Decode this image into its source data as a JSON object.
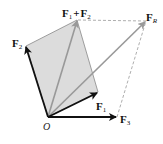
{
  "diagram": {
    "type": "vector-addition",
    "origin": {
      "label": "O",
      "x": 48,
      "y": 117
    },
    "vectors": [
      {
        "id": "F1",
        "label": "F",
        "subscript": "1",
        "tip": {
          "x": 98,
          "y": 92
        },
        "color": "#111111"
      },
      {
        "id": "F2",
        "label": "F",
        "subscript": "2",
        "tip": {
          "x": 26,
          "y": 46
        },
        "color": "#111111"
      },
      {
        "id": "F3",
        "label": "F",
        "subscript": "3",
        "tip": {
          "x": 117,
          "y": 117
        },
        "color": "#111111"
      },
      {
        "id": "F1plusF2",
        "label": "F",
        "subscript": "1",
        "plus": "+",
        "label2": "F",
        "subscript2": "2",
        "tip": {
          "x": 77,
          "y": 20
        },
        "color": "#999999"
      },
      {
        "id": "FR",
        "label": "F",
        "subscript": "R",
        "tip": {
          "x": 146,
          "y": 21
        },
        "color": "#999999"
      }
    ],
    "parallelogram_fill": "#dcdcdc",
    "parallelogram_edge": "#888888",
    "dashed_color": "#999999"
  }
}
